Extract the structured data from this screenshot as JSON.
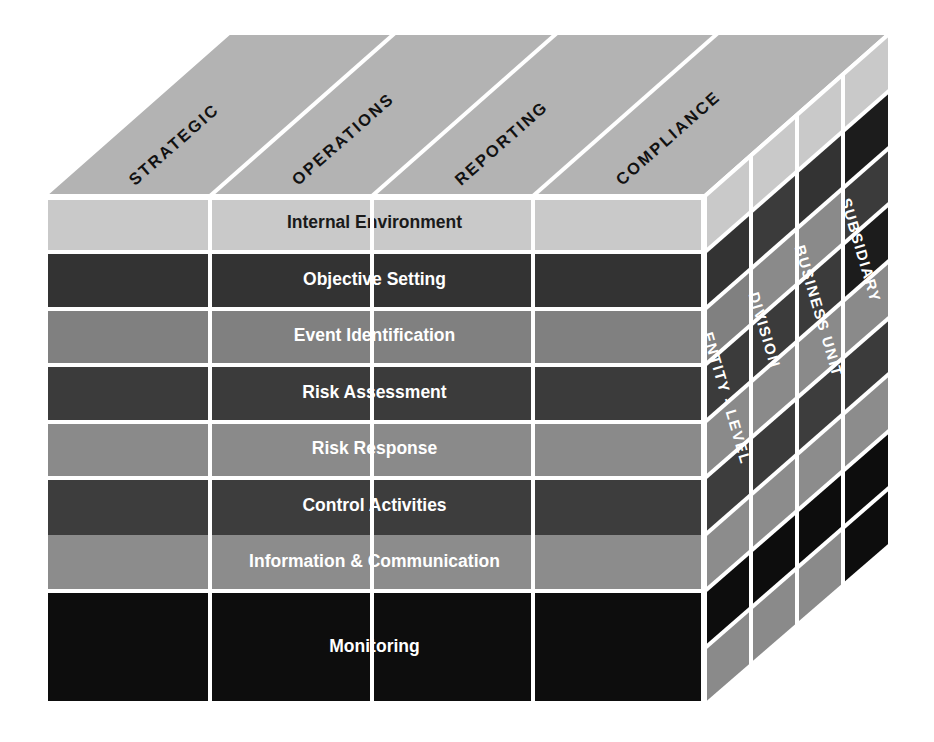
{
  "diagram": {
    "type": "3d-cube-matrix"
  },
  "top_face": {
    "axis_name": "Objectives Categories",
    "labels": [
      {
        "id": "strategic",
        "text": "STRATEGIC"
      },
      {
        "id": "operations",
        "text": "OPERATIONS"
      },
      {
        "id": "reporting",
        "text": "REPORTING"
      },
      {
        "id": "compliance",
        "text": "COMPLIANCE"
      }
    ],
    "face_color": "#b3b3b3",
    "text_color": "#111111"
  },
  "front_face": {
    "axis_name": "Components of Enterprise Risk Management",
    "rows": [
      {
        "id": "internal-environment",
        "text": "Internal Environment",
        "fill": "#c9c9c9",
        "text_color": "#1a1a1a"
      },
      {
        "id": "objective-setting",
        "text": "Objective Setting",
        "fill": "#333333",
        "text_color": "#ffffff"
      },
      {
        "id": "event-identification",
        "text": "Event Identification",
        "fill": "#808080",
        "text_color": "#ffffff"
      },
      {
        "id": "risk-assessment",
        "text": "Risk Assessment",
        "fill": "#3b3b3b",
        "text_color": "#ffffff"
      },
      {
        "id": "risk-response",
        "text": "Risk Response",
        "fill": "#8a8a8a",
        "text_color": "#ffffff"
      },
      {
        "id": "control-activities",
        "text": "Control Activities",
        "fill": "#3d3d3d",
        "text_color": "#ffffff"
      },
      {
        "id": "information-communication",
        "text": "Information & Communication",
        "fill": "#8c8c8c",
        "text_color": "#ffffff"
      },
      {
        "id": "monitoring",
        "text": "Monitoring",
        "fill": "#0d0d0d",
        "text_color": "#ffffff"
      }
    ],
    "column_count": 4,
    "separator_color": "#ffffff"
  },
  "right_face": {
    "axis_name": "Organizational Units",
    "labels": [
      {
        "id": "entity-level",
        "text": "ENTITY - LEVEL"
      },
      {
        "id": "division",
        "text": "DIVISION"
      },
      {
        "id": "business-unit",
        "text": "BUSINESS UNIT"
      },
      {
        "id": "subsidiary",
        "text": "SUBSIDIARY"
      }
    ],
    "text_color": "#ffffff"
  },
  "palette": {
    "background": "#ffffff",
    "top_face": "#b3b3b3",
    "grid_line": "#ffffff",
    "light_gray": "#c9c9c9",
    "mid_gray": "#8a8a8a",
    "dark_gray": "#3b3b3b",
    "near_black": "#0d0d0d"
  }
}
